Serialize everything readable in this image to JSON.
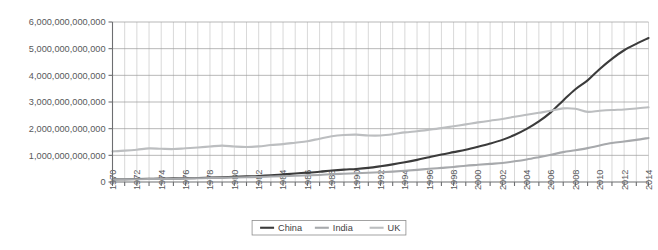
{
  "chart_data": {
    "type": "line",
    "title": "",
    "xlabel": "",
    "ylabel": "",
    "grid": true,
    "legend_position": "bottom-center",
    "xlim": [
      1970,
      2014
    ],
    "ylim": [
      0,
      6000000000000
    ],
    "y_ticks": [
      0,
      1000000000000,
      2000000000000,
      3000000000000,
      4000000000000,
      5000000000000,
      6000000000000
    ],
    "y_tick_labels": [
      "0",
      "1,000,000,000,000",
      "2,000,000,000,000",
      "3,000,000,000,000",
      "4,000,000,000,000",
      "5,000,000,000,000",
      "6,000,000,000,000"
    ],
    "x_tick_labels": [
      "1970",
      "1972",
      "1974",
      "1976",
      "1978",
      "1980",
      "1982",
      "1984",
      "1986",
      "1988",
      "1990",
      "1992",
      "1994",
      "1996",
      "1998",
      "2000",
      "2002",
      "2004",
      "2006",
      "2008",
      "2010",
      "2012",
      "2014"
    ],
    "x": [
      1970,
      1971,
      1972,
      1973,
      1974,
      1975,
      1976,
      1977,
      1978,
      1979,
      1980,
      1981,
      1982,
      1983,
      1984,
      1985,
      1986,
      1987,
      1988,
      1989,
      1990,
      1991,
      1992,
      1993,
      1994,
      1995,
      1996,
      1997,
      1998,
      1999,
      2000,
      2001,
      2002,
      2003,
      2004,
      2005,
      2006,
      2007,
      2008,
      2009,
      2010,
      2011,
      2012,
      2013,
      2014
    ],
    "series": [
      {
        "name": "China",
        "color": "#3b3b3b",
        "width": 2.1,
        "values": [
          100000000000,
          105000000000,
          110000000000,
          118000000000,
          125000000000,
          135000000000,
          140000000000,
          150000000000,
          165000000000,
          180000000000,
          195000000000,
          210000000000,
          225000000000,
          250000000000,
          285000000000,
          320000000000,
          350000000000,
          385000000000,
          430000000000,
          465000000000,
          490000000000,
          530000000000,
          590000000000,
          660000000000,
          740000000000,
          830000000000,
          930000000000,
          1030000000000,
          1120000000000,
          1210000000000,
          1320000000000,
          1440000000000,
          1580000000000,
          1760000000000,
          1990000000000,
          2270000000000,
          2620000000000,
          3060000000000,
          3480000000000,
          3810000000000,
          4240000000000,
          4620000000000,
          4940000000000,
          5180000000000,
          5400000000000
        ]
      },
      {
        "name": "India",
        "color": "#a7a9ac",
        "width": 2.1,
        "values": [
          95000000000,
          100000000000,
          104000000000,
          110000000000,
          116000000000,
          124000000000,
          130000000000,
          140000000000,
          150000000000,
          155000000000,
          168000000000,
          180000000000,
          190000000000,
          205000000000,
          218000000000,
          232000000000,
          248000000000,
          265000000000,
          290000000000,
          310000000000,
          330000000000,
          345000000000,
          365000000000,
          390000000000,
          420000000000,
          455000000000,
          495000000000,
          530000000000,
          565000000000,
          610000000000,
          645000000000,
          680000000000,
          715000000000,
          775000000000,
          845000000000,
          930000000000,
          1020000000000,
          1120000000000,
          1190000000000,
          1270000000000,
          1370000000000,
          1460000000000,
          1520000000000,
          1580000000000,
          1650000000000
        ]
      },
      {
        "name": "UK",
        "color": "#bcbec0",
        "width": 2.1,
        "values": [
          1150000000000,
          1175000000000,
          1210000000000,
          1260000000000,
          1245000000000,
          1235000000000,
          1265000000000,
          1295000000000,
          1330000000000,
          1365000000000,
          1330000000000,
          1310000000000,
          1335000000000,
          1385000000000,
          1420000000000,
          1475000000000,
          1530000000000,
          1625000000000,
          1715000000000,
          1760000000000,
          1775000000000,
          1745000000000,
          1745000000000,
          1790000000000,
          1860000000000,
          1905000000000,
          1960000000000,
          2020000000000,
          2090000000000,
          2160000000000,
          2235000000000,
          2300000000000,
          2360000000000,
          2445000000000,
          2520000000000,
          2595000000000,
          2670000000000,
          2760000000000,
          2745000000000,
          2630000000000,
          2670000000000,
          2700000000000,
          2720000000000,
          2755000000000,
          2800000000000
        ]
      }
    ]
  },
  "legend": {
    "items": [
      {
        "label": "China",
        "color": "#3b3b3b"
      },
      {
        "label": "India",
        "color": "#a7a9ac"
      },
      {
        "label": "UK",
        "color": "#bcbec0"
      }
    ]
  },
  "caption": {
    "text": ""
  }
}
